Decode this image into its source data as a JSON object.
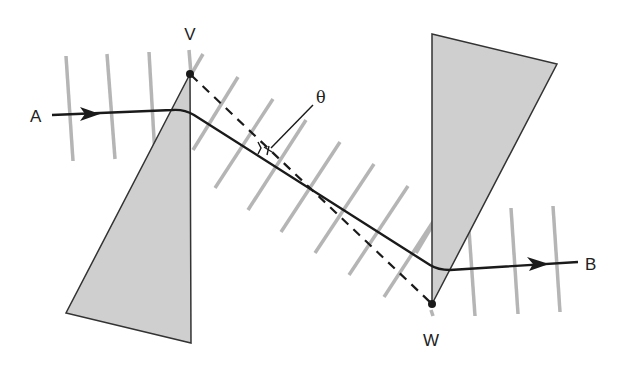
{
  "diagram": {
    "type": "ray-optics-prism-pair",
    "labels": {
      "start": "A",
      "end": "B",
      "vertex_top": "V",
      "vertex_bottom": "W",
      "angle": "θ"
    },
    "colors": {
      "background": "#ffffff",
      "prism_fill": "#cfcfcf",
      "prism_stroke": "#333333",
      "ray": "#1a1a1a",
      "wavefront": "#b5b5b5",
      "dashed_line": "#1a1a1a"
    },
    "elements": [
      {
        "id": "prism-left",
        "kind": "triangle",
        "description": "Gray wedge with apex at V pointing up"
      },
      {
        "id": "prism-right",
        "kind": "triangle",
        "description": "Gray wedge with apex at W pointing down"
      },
      {
        "id": "ray",
        "kind": "polyline-arrow",
        "description": "Light ray from A through both prisms to B"
      },
      {
        "id": "dashed-vw",
        "kind": "dashed-line",
        "description": "Straight dashed line from V to W"
      },
      {
        "id": "wavefronts-left",
        "kind": "parallel-lines",
        "count": 4,
        "orientation": "near-vertical"
      },
      {
        "id": "wavefronts-middle",
        "kind": "parallel-lines",
        "count": 8,
        "orientation": "tilted"
      },
      {
        "id": "wavefronts-right",
        "kind": "parallel-lines",
        "count": 3,
        "orientation": "near-vertical"
      },
      {
        "id": "angle-marker",
        "kind": "annotation",
        "description": "θ label with leader line pointing to angle between ray and dashed line"
      }
    ]
  }
}
